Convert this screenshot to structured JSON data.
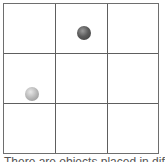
{
  "board": {
    "rows": 3,
    "cols": 3,
    "line_color": "#5e5e5e"
  },
  "pieces": [
    {
      "name": "dark-ball",
      "row": 0,
      "col": 1,
      "color": "dark"
    },
    {
      "name": "light-ball",
      "row": 1,
      "col": 0,
      "color": "light"
    }
  ],
  "caption": "There are objects placed in different cells"
}
